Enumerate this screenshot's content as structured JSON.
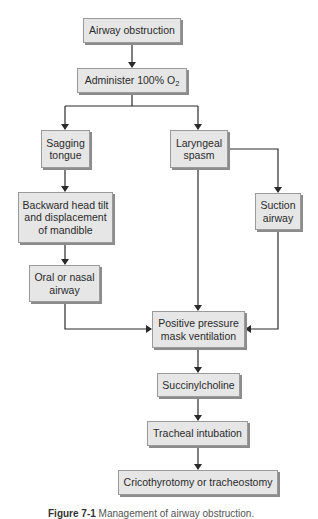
{
  "diagram": {
    "type": "flowchart",
    "nodes": [
      {
        "id": "airway_obstruction",
        "label": "Airway obstruction"
      },
      {
        "id": "administer_o2",
        "label_prefix": "Administer 100% O",
        "label_sub": "2"
      },
      {
        "id": "sagging_tongue",
        "label": "Sagging\ntongue"
      },
      {
        "id": "laryngeal_spasm",
        "label": "Laryngeal\nspasm"
      },
      {
        "id": "head_tilt",
        "label": "Backward head tilt\nand displacement\nof mandible"
      },
      {
        "id": "suction_airway",
        "label": "Suction\nairway"
      },
      {
        "id": "oral_nasal_airway",
        "label": "Oral or nasal\nairway"
      },
      {
        "id": "ppv",
        "label": "Positive pressure\nmask ventilation"
      },
      {
        "id": "succinylcholine",
        "label": "Succinylcholine"
      },
      {
        "id": "tracheal_intubation",
        "label": "Tracheal intubation"
      },
      {
        "id": "cricothyrotomy",
        "label": "Cricothyrotomy or tracheostomy"
      }
    ],
    "edges": [
      [
        "airway_obstruction",
        "administer_o2"
      ],
      [
        "administer_o2",
        "sagging_tongue"
      ],
      [
        "administer_o2",
        "laryngeal_spasm"
      ],
      [
        "sagging_tongue",
        "head_tilt"
      ],
      [
        "head_tilt",
        "oral_nasal_airway"
      ],
      [
        "oral_nasal_airway",
        "ppv"
      ],
      [
        "laryngeal_spasm",
        "ppv"
      ],
      [
        "laryngeal_spasm",
        "suction_airway"
      ],
      [
        "suction_airway",
        "ppv"
      ],
      [
        "ppv",
        "succinylcholine"
      ],
      [
        "succinylcholine",
        "tracheal_intubation"
      ],
      [
        "tracheal_intubation",
        "cricothyrotomy"
      ]
    ],
    "caption": {
      "figure": "Figure 7-1",
      "text": "Management of airway obstruction."
    },
    "colors": {
      "box_fill": "#e6e6e6",
      "box_border": "#9a9a9a",
      "shadow": "#8c8c8c",
      "line": "#2a2a2a"
    }
  }
}
